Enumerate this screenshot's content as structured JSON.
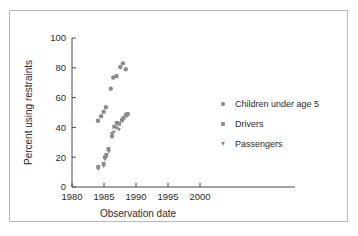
{
  "figure": {
    "background": "#ffffff",
    "frame_color": "#b9b9b9",
    "marker_color": "#8a8a8a",
    "axis_color": "#4a4a4a"
  },
  "chart_data": {
    "type": "scatter",
    "title": "",
    "xlabel": "Observation date",
    "ylabel": "Percent using restraints",
    "xlim": [
      1980,
      2000
    ],
    "ylim": [
      0,
      100
    ],
    "xticks": [
      1980,
      1985,
      1990,
      1995,
      2000
    ],
    "yticks": [
      0,
      20,
      40,
      60,
      80,
      100
    ],
    "xtick_labels": [
      "1980",
      "1985",
      "1990",
      "1995",
      "2000"
    ],
    "ytick_labels": [
      "0",
      "20",
      "40",
      "60",
      "80",
      "100"
    ],
    "grid": false,
    "legend_position": "right",
    "series": [
      {
        "name": "Children under age 5",
        "marker": "circle",
        "color": "#8a8a8a",
        "points": [
          {
            "x": 1984.05,
            "y": 44.5
          },
          {
            "x": 1984.55,
            "y": 47.5
          },
          {
            "x": 1984.95,
            "y": 50.5
          },
          {
            "x": 1985.3,
            "y": 53.5
          },
          {
            "x": 1986.05,
            "y": 66.0
          },
          {
            "x": 1986.45,
            "y": 73.5
          },
          {
            "x": 1986.95,
            "y": 74.5
          },
          {
            "x": 1987.55,
            "y": 80.5
          },
          {
            "x": 1987.95,
            "y": 83.0
          },
          {
            "x": 1988.4,
            "y": 79.0
          }
        ]
      },
      {
        "name": "Drivers",
        "marker": "square",
        "color": "#8a8a8a",
        "points": [
          {
            "x": 1984.1,
            "y": 13.5
          },
          {
            "x": 1984.95,
            "y": 15.5
          },
          {
            "x": 1985.15,
            "y": 20.0
          },
          {
            "x": 1985.35,
            "y": 21.5
          },
          {
            "x": 1985.7,
            "y": 25.5
          },
          {
            "x": 1986.25,
            "y": 34.0
          },
          {
            "x": 1986.6,
            "y": 40.5
          },
          {
            "x": 1987.0,
            "y": 43.0
          },
          {
            "x": 1987.35,
            "y": 42.5
          },
          {
            "x": 1987.8,
            "y": 45.0
          },
          {
            "x": 1988.05,
            "y": 46.5
          },
          {
            "x": 1988.45,
            "y": 48.5
          },
          {
            "x": 1988.7,
            "y": 49.0
          }
        ]
      },
      {
        "name": "Passengers",
        "marker": "triangle-down",
        "color": "#8a8a8a",
        "points": [
          {
            "x": 1984.1,
            "y": 12.0
          },
          {
            "x": 1984.95,
            "y": 14.0
          },
          {
            "x": 1985.15,
            "y": 18.5
          },
          {
            "x": 1985.4,
            "y": 20.0
          },
          {
            "x": 1985.75,
            "y": 23.5
          },
          {
            "x": 1986.25,
            "y": 35.5
          },
          {
            "x": 1986.55,
            "y": 36.5
          },
          {
            "x": 1987.0,
            "y": 39.5
          },
          {
            "x": 1987.35,
            "y": 38.5
          },
          {
            "x": 1987.85,
            "y": 44.0
          },
          {
            "x": 1988.1,
            "y": 45.5
          },
          {
            "x": 1988.5,
            "y": 47.5
          },
          {
            "x": 1988.72,
            "y": 48.0
          }
        ]
      }
    ],
    "legend": [
      {
        "label": "Children under age 5",
        "marker": "circle"
      },
      {
        "label": "Drivers",
        "marker": "square"
      },
      {
        "label": "Passengers",
        "marker": "triangle-down"
      }
    ]
  }
}
